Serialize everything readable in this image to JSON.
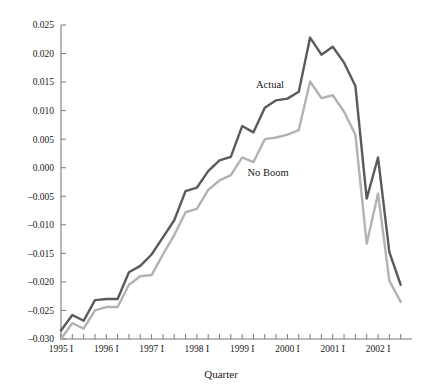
{
  "chart_data": {
    "type": "line",
    "title": "",
    "xlabel": "Quarter",
    "ylabel": "",
    "ylim": [
      -0.03,
      0.025
    ],
    "ytick_labels": [
      "0.025",
      "0.020",
      "0.015",
      "0.010",
      "0.005",
      "0.000",
      "-0.005",
      "-0.010",
      "-0.015",
      "-0.020",
      "-0.025",
      "-0.030"
    ],
    "ytick_values": [
      0.025,
      0.02,
      0.015,
      0.01,
      0.005,
      0.0,
      -0.005,
      -0.01,
      -0.015,
      -0.02,
      -0.025,
      -0.03
    ],
    "xtick_labels": [
      "1995 I",
      "1996 I",
      "1997 I",
      "1998 I",
      "1999 I",
      "2000 I",
      "2001 I",
      "2002 I"
    ],
    "x": [
      "1995 I",
      "1995 II",
      "1995 III",
      "1995 IV",
      "1996 I",
      "1996 II",
      "1996 III",
      "1996 IV",
      "1997 I",
      "1997 II",
      "1997 III",
      "1997 IV",
      "1998 I",
      "1998 II",
      "1998 III",
      "1998 IV",
      "1999 I",
      "1999 II",
      "1999 III",
      "1999 IV",
      "2000 I",
      "2000 II",
      "2000 III",
      "2000 IV",
      "2001 I",
      "2001 II",
      "2001 III",
      "2001 IV",
      "2002 I",
      "2002 II",
      "2002 III"
    ],
    "grid": false,
    "legend_position": "inline-annotation",
    "series": [
      {
        "name": "Actual",
        "color": "#5a5a5a",
        "label_x_index": 18,
        "values": [
          -0.0285,
          -0.0258,
          -0.0268,
          -0.0232,
          -0.023,
          -0.023,
          -0.0183,
          -0.0172,
          -0.0152,
          -0.0122,
          -0.0092,
          -0.0041,
          -0.0035,
          -0.0006,
          0.0013,
          0.0019,
          0.0073,
          0.0062,
          0.0105,
          0.0118,
          0.0121,
          0.0133,
          0.0228,
          0.0198,
          0.0212,
          0.0184,
          0.0143,
          -0.0054,
          0.0018,
          -0.0148,
          -0.0205
        ]
      },
      {
        "name": "No Boom",
        "color": "#b2b2b2",
        "label_x_index": 17,
        "values": [
          -0.03,
          -0.0272,
          -0.0282,
          -0.025,
          -0.0244,
          -0.0244,
          -0.0205,
          -0.019,
          -0.0188,
          -0.0152,
          -0.0118,
          -0.0078,
          -0.0072,
          -0.0039,
          -0.0022,
          -0.0013,
          0.0018,
          0.001,
          0.005,
          0.0053,
          0.0058,
          0.0066,
          0.0151,
          0.0122,
          0.0127,
          0.0098,
          0.0058,
          -0.0133,
          -0.0045,
          -0.0198,
          -0.0235
        ]
      }
    ]
  }
}
